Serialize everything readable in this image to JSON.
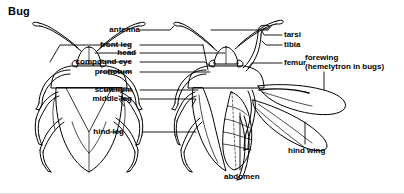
{
  "figure": {
    "title": "Bug",
    "background_color": "#ffffff",
    "line_color": "#000000",
    "text_color": "#000000"
  },
  "labels": {
    "antenna": "antenna",
    "front_leg": "front leg",
    "head": "head",
    "compound_eye": "compound eye",
    "pronotum": "pronotum",
    "scutellum": "scutellum",
    "middle_leg": "middle leg",
    "hind_leg": "hind leg",
    "tarsi": "tarsi",
    "tibia": "tibia",
    "femur": "femur",
    "forewing_line1": "forewing",
    "forewing_line2": "(hemelytron in bugs)",
    "hind_wing": "hind wing",
    "abdomen": "abdomen"
  },
  "diagram": {
    "type": "labeled-anatomy-illustration",
    "views": [
      {
        "name": "dorsal-view-wings-closed",
        "position": "left"
      },
      {
        "name": "dorsal-view-wings-spread",
        "position": "right"
      }
    ],
    "label_count": 14
  }
}
